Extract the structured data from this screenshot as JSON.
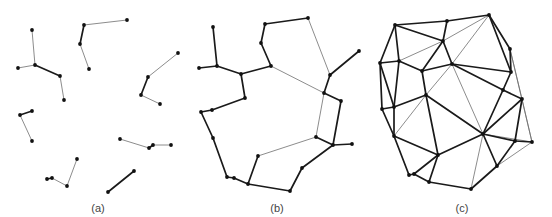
{
  "colors": {
    "background": "#ffffff",
    "thick_edge": "#1a1a1a",
    "thin_edge": "#6e6e6e",
    "node": "#111111",
    "label": "#444444"
  },
  "panels": [
    {
      "id": "a",
      "label": "(a)",
      "label_pos": [
        98,
        211
      ],
      "nodes": [
        [
          32,
          30
        ],
        [
          35,
          65
        ],
        [
          18,
          68
        ],
        [
          60,
          76
        ],
        [
          64,
          100
        ],
        [
          84,
          25
        ],
        [
          127,
          20
        ],
        [
          80,
          44
        ],
        [
          89,
          69
        ],
        [
          178,
          53
        ],
        [
          148,
          77
        ],
        [
          141,
          95
        ],
        [
          160,
          104
        ],
        [
          20,
          115
        ],
        [
          32,
          111
        ],
        [
          32,
          141
        ],
        [
          120,
          139
        ],
        [
          149,
          148
        ],
        [
          153,
          145
        ],
        [
          171,
          145
        ],
        [
          47,
          179
        ],
        [
          52,
          178
        ],
        [
          67,
          186
        ],
        [
          77,
          159
        ],
        [
          108,
          192
        ],
        [
          134,
          171
        ]
      ],
      "edges": [
        [
          0,
          1,
          "thin"
        ],
        [
          1,
          2,
          "thin"
        ],
        [
          1,
          3,
          "thick"
        ],
        [
          3,
          4,
          "thin"
        ],
        [
          5,
          6,
          "thin"
        ],
        [
          5,
          7,
          "thick"
        ],
        [
          7,
          8,
          "thin"
        ],
        [
          9,
          10,
          "thin"
        ],
        [
          10,
          11,
          "thick"
        ],
        [
          11,
          12,
          "thin"
        ],
        [
          13,
          14,
          "thick"
        ],
        [
          13,
          15,
          "thin"
        ],
        [
          16,
          17,
          "thin"
        ],
        [
          17,
          18,
          "thick"
        ],
        [
          18,
          19,
          "thin"
        ],
        [
          20,
          21,
          "thick"
        ],
        [
          21,
          22,
          "thin"
        ],
        [
          22,
          23,
          "thin"
        ],
        [
          24,
          25,
          "thick"
        ]
      ]
    },
    {
      "id": "b",
      "label": "(b)",
      "label_pos": [
        277,
        211
      ],
      "nodes": [
        [
          213,
          27
        ],
        [
          217,
          66
        ],
        [
          199,
          68
        ],
        [
          241,
          74
        ],
        [
          245,
          98
        ],
        [
          212,
          110
        ],
        [
          201,
          112
        ],
        [
          213,
          138
        ],
        [
          227,
          177
        ],
        [
          234,
          178
        ],
        [
          248,
          184
        ],
        [
          258,
          156
        ],
        [
          290,
          191
        ],
        [
          302,
          168
        ],
        [
          316,
          137
        ],
        [
          333,
          145
        ],
        [
          352,
          144
        ],
        [
          341,
          101
        ],
        [
          324,
          93
        ],
        [
          330,
          75
        ],
        [
          359,
          51
        ],
        [
          308,
          18
        ],
        [
          265,
          24
        ],
        [
          261,
          43
        ],
        [
          271,
          66
        ]
      ],
      "edges": [
        [
          0,
          1,
          "thick"
        ],
        [
          1,
          2,
          "thick"
        ],
        [
          1,
          3,
          "thick"
        ],
        [
          3,
          4,
          "thick"
        ],
        [
          4,
          5,
          "thick"
        ],
        [
          5,
          6,
          "thick"
        ],
        [
          6,
          7,
          "thick"
        ],
        [
          7,
          8,
          "thick"
        ],
        [
          8,
          9,
          "thick"
        ],
        [
          9,
          10,
          "thick"
        ],
        [
          10,
          11,
          "thick"
        ],
        [
          10,
          12,
          "thick"
        ],
        [
          12,
          13,
          "thick"
        ],
        [
          13,
          15,
          "thick"
        ],
        [
          15,
          14,
          "thick"
        ],
        [
          14,
          11,
          "thin"
        ],
        [
          15,
          16,
          "thick"
        ],
        [
          15,
          17,
          "thick"
        ],
        [
          17,
          18,
          "thick"
        ],
        [
          18,
          19,
          "thick"
        ],
        [
          19,
          20,
          "thick"
        ],
        [
          19,
          21,
          "thin"
        ],
        [
          21,
          22,
          "thick"
        ],
        [
          22,
          23,
          "thick"
        ],
        [
          23,
          24,
          "thick"
        ],
        [
          24,
          3,
          "thick"
        ],
        [
          24,
          18,
          "thin"
        ],
        [
          18,
          14,
          "thin"
        ]
      ]
    },
    {
      "id": "c",
      "label": "(c)",
      "label_pos": [
        462,
        211
      ],
      "nodes": [
        [
          395,
          25
        ],
        [
          447,
          21
        ],
        [
          489,
          15
        ],
        [
          443,
          41
        ],
        [
          380,
          63
        ],
        [
          399,
          61
        ],
        [
          422,
          71
        ],
        [
          452,
          64
        ],
        [
          510,
          49
        ],
        [
          511,
          72
        ],
        [
          503,
          90
        ],
        [
          522,
          99
        ],
        [
          426,
          95
        ],
        [
          382,
          109
        ],
        [
          394,
          107
        ],
        [
          394,
          136
        ],
        [
          483,
          134
        ],
        [
          515,
          141
        ],
        [
          532,
          142
        ],
        [
          438,
          155
        ],
        [
          409,
          175
        ],
        [
          414,
          174
        ],
        [
          429,
          182
        ],
        [
          497,
          166
        ],
        [
          471,
          189
        ]
      ],
      "edges": [
        [
          0,
          1,
          "thick"
        ],
        [
          1,
          2,
          "thick"
        ],
        [
          0,
          3,
          "thick"
        ],
        [
          1,
          3,
          "thick"
        ],
        [
          2,
          3,
          "thin"
        ],
        [
          2,
          7,
          "thin"
        ],
        [
          2,
          9,
          "thick"
        ],
        [
          2,
          8,
          "thick"
        ],
        [
          0,
          4,
          "thick"
        ],
        [
          0,
          5,
          "thick"
        ],
        [
          4,
          5,
          "thick"
        ],
        [
          5,
          3,
          "thin"
        ],
        [
          3,
          6,
          "thick"
        ],
        [
          5,
          6,
          "thick"
        ],
        [
          6,
          7,
          "thick"
        ],
        [
          3,
          7,
          "thick"
        ],
        [
          7,
          9,
          "thick"
        ],
        [
          8,
          9,
          "thick"
        ],
        [
          8,
          11,
          "thin"
        ],
        [
          8,
          18,
          "thin"
        ],
        [
          7,
          10,
          "thick"
        ],
        [
          10,
          11,
          "thick"
        ],
        [
          9,
          10,
          "thick"
        ],
        [
          4,
          13,
          "thick"
        ],
        [
          4,
          14,
          "thick"
        ],
        [
          5,
          14,
          "thick"
        ],
        [
          13,
          14,
          "thick"
        ],
        [
          6,
          12,
          "thick"
        ],
        [
          7,
          12,
          "thin"
        ],
        [
          12,
          14,
          "thick"
        ],
        [
          13,
          15,
          "thick"
        ],
        [
          14,
          15,
          "thick"
        ],
        [
          12,
          15,
          "thin"
        ],
        [
          12,
          19,
          "thick"
        ],
        [
          12,
          16,
          "thick"
        ],
        [
          7,
          16,
          "thin"
        ],
        [
          10,
          16,
          "thick"
        ],
        [
          11,
          16,
          "thick"
        ],
        [
          11,
          17,
          "thick"
        ],
        [
          11,
          18,
          "thin"
        ],
        [
          16,
          17,
          "thick"
        ],
        [
          16,
          18,
          "thin"
        ],
        [
          17,
          18,
          "thick"
        ],
        [
          15,
          19,
          "thick"
        ],
        [
          15,
          20,
          "thick"
        ],
        [
          19,
          21,
          "thick"
        ],
        [
          19,
          22,
          "thick"
        ],
        [
          20,
          21,
          "thick"
        ],
        [
          21,
          22,
          "thick"
        ],
        [
          22,
          24,
          "thick"
        ],
        [
          16,
          19,
          "thick"
        ],
        [
          16,
          24,
          "thin"
        ],
        [
          16,
          23,
          "thick"
        ],
        [
          17,
          23,
          "thick"
        ],
        [
          18,
          23,
          "thin"
        ],
        [
          23,
          24,
          "thick"
        ]
      ]
    }
  ]
}
